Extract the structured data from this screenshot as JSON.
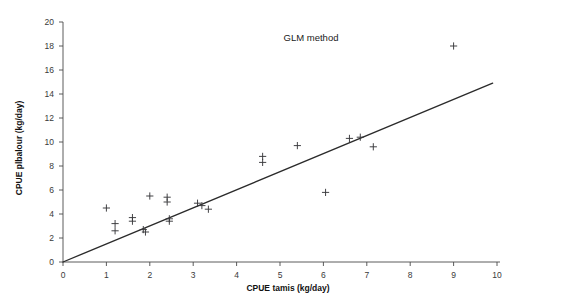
{
  "chart_data": {
    "type": "scatter",
    "title": "GLM method",
    "xlabel": "CPUE tamis (kg/day)",
    "ylabel": "CPUE plbalour (kg/day)",
    "xlim": [
      0,
      10
    ],
    "ylim": [
      0,
      20
    ],
    "xticks": [
      0,
      1,
      2,
      3,
      4,
      5,
      6,
      7,
      8,
      9,
      10
    ],
    "yticks": [
      0,
      2,
      4,
      6,
      8,
      10,
      12,
      14,
      16,
      18,
      20
    ],
    "xtick_labels": [
      "0",
      "1",
      "2",
      "3",
      "4",
      "5",
      "6",
      "7",
      "8",
      "9",
      "10"
    ],
    "ytick_labels": [
      "0",
      "2",
      "4",
      "6",
      "8",
      "10",
      "12",
      "14",
      "16",
      "18",
      "20"
    ],
    "grid": false,
    "legend": null,
    "marker": "plus",
    "marker_color": "#39393c",
    "line_color": "#2b2b2b",
    "series": [
      {
        "name": "observations",
        "type": "scatter",
        "points": [
          {
            "x": 1.0,
            "y": 4.5
          },
          {
            "x": 1.2,
            "y": 3.2
          },
          {
            "x": 1.2,
            "y": 2.6
          },
          {
            "x": 1.6,
            "y": 3.7
          },
          {
            "x": 1.6,
            "y": 3.4
          },
          {
            "x": 1.85,
            "y": 2.7
          },
          {
            "x": 1.9,
            "y": 2.5
          },
          {
            "x": 2.0,
            "y": 5.5
          },
          {
            "x": 2.4,
            "y": 5.4
          },
          {
            "x": 2.4,
            "y": 5.0
          },
          {
            "x": 2.45,
            "y": 3.6
          },
          {
            "x": 2.45,
            "y": 3.4
          },
          {
            "x": 3.1,
            "y": 4.9
          },
          {
            "x": 3.2,
            "y": 4.7
          },
          {
            "x": 3.35,
            "y": 4.4
          },
          {
            "x": 4.6,
            "y": 8.8
          },
          {
            "x": 4.6,
            "y": 8.3
          },
          {
            "x": 5.4,
            "y": 9.7
          },
          {
            "x": 6.05,
            "y": 5.8
          },
          {
            "x": 6.6,
            "y": 10.3
          },
          {
            "x": 6.85,
            "y": 10.4
          },
          {
            "x": 7.15,
            "y": 9.6
          },
          {
            "x": 9.0,
            "y": 18.0
          }
        ]
      },
      {
        "name": "fit-line",
        "type": "line",
        "points": [
          {
            "x": 0.0,
            "y": 0.0
          },
          {
            "x": 9.9,
            "y": 14.9
          }
        ]
      }
    ]
  }
}
